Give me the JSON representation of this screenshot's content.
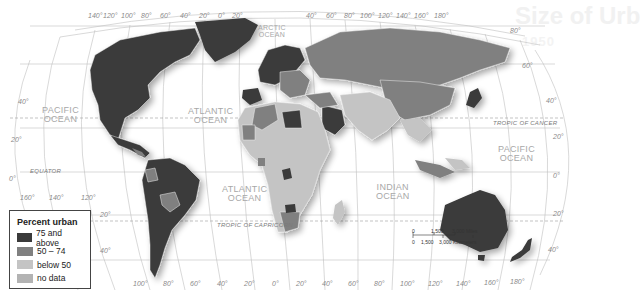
{
  "ghost_header": {
    "title": "Size of Urb",
    "subtitle": "1950"
  },
  "legend": {
    "title": "Percent urban",
    "items": [
      {
        "label": "75 and above",
        "color": "#3a3a3a"
      },
      {
        "label": "50 – 74",
        "color": "#808080"
      },
      {
        "label": "below 50",
        "color": "#c4c4c4"
      },
      {
        "label": "no data",
        "color": "#b3b3b3"
      }
    ]
  },
  "oceans": {
    "pacific_west": [
      "PACIFIC",
      "OCEAN"
    ],
    "atlantic_north": [
      "ATLANTIC",
      "OCEAN"
    ],
    "atlantic_south": [
      "ATLANTIC",
      "OCEAN"
    ],
    "arctic": [
      "ARCTIC",
      "OCEAN"
    ],
    "indian": [
      "INDIAN",
      "OCEAN"
    ],
    "pacific_east": [
      "PACIFIC",
      "OCEAN"
    ]
  },
  "lines": {
    "equator": "EQUATOR",
    "tropic_cancer": "TROPIC OF CANCER",
    "tropic_capricorn": "TROPIC OF CAPRICORN"
  },
  "longitudes_top": [
    "140°",
    "120°",
    "100°",
    "80°",
    "60°",
    "40°",
    "20°",
    "0°",
    "20°",
    "40°",
    "60°",
    "80°",
    "100°",
    "120°",
    "140°",
    "160°",
    "180°"
  ],
  "longitudes_bottom": [
    "160°",
    "140°",
    "120°",
    "100°",
    "80°",
    "60°",
    "40°",
    "20°",
    "0°",
    "20°",
    "40°",
    "60°",
    "80°",
    "100°",
    "120°",
    "140°",
    "160°",
    "180°"
  ],
  "latitudes_left": [
    "40°",
    "20°",
    "0°",
    "20°",
    "40°"
  ],
  "latitudes_right": [
    "80°",
    "60°",
    "40°",
    "20°",
    "0°",
    "20°",
    "40°"
  ],
  "scale": {
    "miles": [
      "0",
      "1,500",
      "3,000 Miles"
    ],
    "kilometers": [
      "0",
      "1,500",
      "3,000 Kilometers"
    ]
  },
  "colors": {
    "high": "#3a3a3a",
    "mid": "#808080",
    "low": "#c4c4c4",
    "nodata": "#b3b3b3",
    "grid": "#b8b8b8"
  }
}
